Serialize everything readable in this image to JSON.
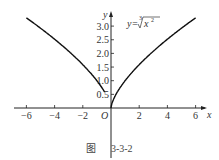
{
  "chart_data": {
    "type": "line",
    "title": "",
    "function_label": "y=∛(x²)",
    "xlabel": "x",
    "ylabel": "y",
    "origin_label": "O",
    "xlim": [
      -7,
      6.5
    ],
    "ylim": [
      0,
      3.4
    ],
    "x_ticks": [
      -6,
      -4,
      -2,
      2,
      4,
      6
    ],
    "x_tick_labels": [
      "−6",
      "−4",
      "−2",
      "2",
      "4",
      "6"
    ],
    "y_ticks": [
      0.5,
      1.0,
      1.5,
      2.0,
      2.5,
      3.0
    ],
    "y_tick_labels": [
      "0.5",
      "1.0",
      "1.5",
      "2.0",
      "2.5",
      "3.0"
    ],
    "grid": false,
    "series": [
      {
        "name": "y = x^(2/3)",
        "x": [
          -6,
          -5,
          -4,
          -3,
          -2,
          -1,
          -0.5,
          0,
          0.5,
          1,
          2,
          3,
          4,
          5,
          6
        ],
        "y": [
          3.3,
          2.92,
          2.52,
          2.08,
          1.59,
          1.0,
          0.63,
          0,
          0.63,
          1.0,
          1.59,
          2.08,
          2.52,
          2.92,
          3.3
        ]
      }
    ]
  },
  "caption": {
    "prefix": "图",
    "number": "3-3-2"
  }
}
